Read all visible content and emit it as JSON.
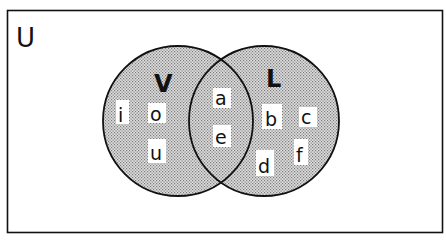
{
  "diagram": {
    "type": "venn",
    "universe_label": "U",
    "sets": [
      {
        "id": "V",
        "label": "V",
        "only_elements": [
          "i",
          "o",
          "u"
        ]
      },
      {
        "id": "L",
        "label": "L",
        "only_elements": [
          "b",
          "c",
          "d",
          "f"
        ]
      }
    ],
    "intersection": {
      "sets": [
        "V",
        "L"
      ],
      "elements": [
        "a",
        "e"
      ]
    },
    "colors": {
      "stroke": "#111111",
      "fill_dot": "#8a8a8a",
      "fill_bg": "#dcdcdc",
      "background": "#ffffff"
    }
  },
  "labels": {
    "U": "U",
    "V": "V",
    "L": "L",
    "i": "i",
    "o": "o",
    "u": "u",
    "a": "a",
    "e": "e",
    "b": "b",
    "c": "c",
    "d": "d",
    "f": "f"
  }
}
